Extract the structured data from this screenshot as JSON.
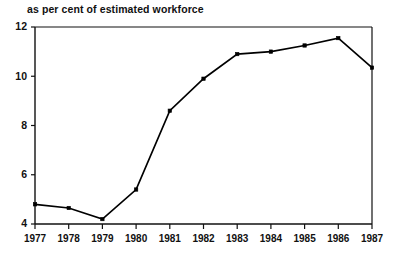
{
  "chart_data": {
    "type": "line",
    "title": "as per cent of estimated workforce",
    "xlabel": "",
    "ylabel": "",
    "categories": [
      "1977",
      "1978",
      "1979",
      "1980",
      "1981",
      "1982",
      "1983",
      "1984",
      "1985",
      "1986",
      "1987"
    ],
    "values": [
      4.8,
      4.65,
      4.2,
      5.4,
      8.6,
      9.9,
      10.9,
      11.0,
      11.25,
      11.55,
      10.35
    ],
    "series": [
      {
        "name": "unemployment as per cent of estimated workforce",
        "values": [
          4.8,
          4.65,
          4.2,
          5.4,
          8.6,
          9.9,
          10.9,
          11.0,
          11.25,
          11.55,
          10.35
        ]
      }
    ],
    "xlim": [
      1977,
      1987
    ],
    "ylim": [
      4,
      12
    ],
    "ytick_labels": [
      "4",
      "6",
      "8",
      "10",
      "12"
    ],
    "ytick_values": [
      4,
      6,
      8,
      10,
      12
    ],
    "xtick_labels": [
      "1977",
      "1978",
      "1979",
      "1980",
      "1981",
      "1982",
      "1983",
      "1984",
      "1985",
      "1986",
      "1987"
    ],
    "grid": false,
    "legend": false,
    "legend_position": "none",
    "marker": "square",
    "line_color": "#000000",
    "marker_color": "#000000",
    "axis_color": "#111111",
    "background_color": "#ffffff"
  }
}
